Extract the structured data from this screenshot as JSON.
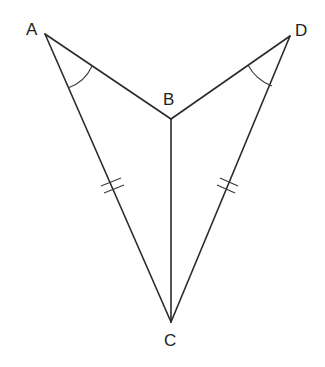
{
  "diagram": {
    "type": "geometry",
    "vertices": {
      "A": {
        "label": "A",
        "x": 45,
        "y": 34
      },
      "B": {
        "label": "B",
        "x": 171,
        "y": 119
      },
      "C": {
        "label": "C",
        "x": 171,
        "y": 322
      },
      "D": {
        "label": "D",
        "x": 290,
        "y": 36
      }
    },
    "segments": [
      "AB",
      "BD",
      "AC",
      "DC",
      "BC"
    ],
    "equal_segments": [
      [
        "AC",
        "DC"
      ]
    ],
    "tick_marks": {
      "AC": 2,
      "DC": 2
    },
    "equal_angles": [
      [
        "BAC",
        "BDC"
      ]
    ],
    "angle_arcs": {
      "A": 1,
      "D": 1
    },
    "colors": {
      "line": "#2a2a2a",
      "text": "#222222",
      "background": "#ffffff"
    }
  },
  "labels": {
    "A": "A",
    "B": "B",
    "C": "C",
    "D": "D"
  }
}
